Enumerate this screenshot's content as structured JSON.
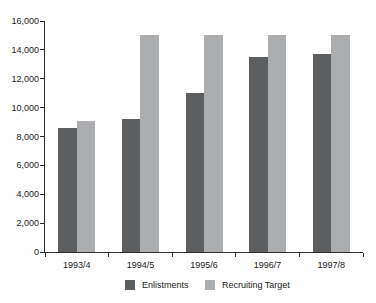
{
  "chart_data": {
    "type": "bar",
    "title": "",
    "xlabel": "",
    "ylabel": "",
    "categories": [
      "1993/4",
      "1994/5",
      "1995/6",
      "1996/7",
      "1997/8"
    ],
    "series": [
      {
        "name": "Enlistments",
        "color": "#5d5e60",
        "values": [
          8600,
          9200,
          11000,
          13500,
          13700
        ]
      },
      {
        "name": "Recruiting Target",
        "color": "#abadaf",
        "values": [
          9100,
          15000,
          15000,
          15000,
          15000
        ]
      }
    ],
    "ylim": [
      0,
      16000
    ],
    "ytick_step": 2000,
    "ytick_labels": [
      "0",
      "2,000",
      "4,000",
      "6,000",
      "8,000",
      "10,000",
      "12,000",
      "14,000",
      "16,000"
    ],
    "grid": false,
    "legend_position": "bottom",
    "axis_color": "#2e2e2e",
    "background_color": "#fefefe"
  }
}
